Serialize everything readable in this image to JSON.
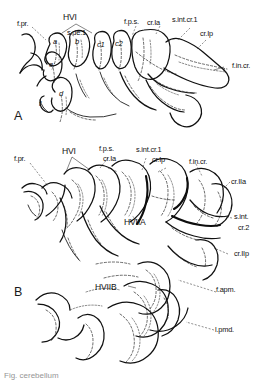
{
  "figure": {
    "caption": "Fig.  cerebellum",
    "ink_color": "#111111",
    "background_color": "#ffffff"
  },
  "panels": [
    {
      "id": "A",
      "label": "A"
    },
    {
      "id": "B",
      "label": "B"
    }
  ],
  "panel_a": {
    "label": "A",
    "labels": {
      "f_pr": "f.pr.",
      "hvi": "HVI",
      "s_de_1": "s.de.1",
      "f_ps": "f.p.s.",
      "cr_1a": "cr.Ia",
      "s_int_cr_1": "s.int.cr.1",
      "cr_1p": "cr.Ip",
      "f_in_cr": "f.in.cr."
    },
    "lobules": {
      "a": "a",
      "b": "b",
      "c1": "c1",
      "c2": "c2",
      "d": "d",
      "e": "e",
      "f": "f"
    }
  },
  "panel_b": {
    "label": "B",
    "labels": {
      "f_pr": "f.pr.",
      "hvi": "HVI",
      "f_ps": "f.p.s.",
      "cr_1a": "cr.Ia",
      "s_int_cr_1": "s.int.cr.1",
      "cr_1p": "cr.Ip",
      "f_in_cr": "f.in.cr.",
      "cr_2a": "cr.IIa",
      "s_int": "s.int.",
      "cr_2": "cr.2",
      "cr_2p": "cr.IIp",
      "hviia": "HVIIA",
      "hviib": "HVIIB",
      "f_apm": "f.apm.",
      "l_pmd": "l.pmd."
    }
  }
}
